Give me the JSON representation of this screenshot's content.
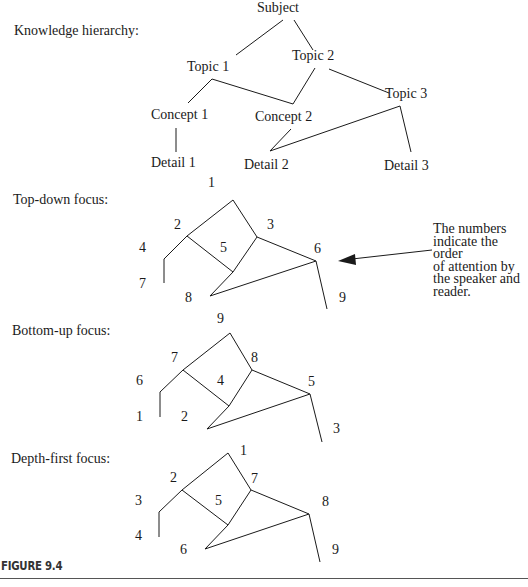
{
  "hierarchy": {
    "title": "Knowledge hierarchy:",
    "nodes": {
      "subject": "Subject",
      "topic1": "Topic 1",
      "topic2": "Topic 2",
      "topic3": "Topic 3",
      "concept1": "Concept 1",
      "concept2": "Concept 2",
      "detail1": "Detail 1",
      "detail2": "Detail 2",
      "detail3": "Detail 3"
    }
  },
  "top_down": {
    "title": "Top-down focus:",
    "order": {
      "subject": "1",
      "topic1": "2",
      "topic2": "3",
      "concept1": "4",
      "concept2": "5",
      "topic3": "6",
      "detail1": "7",
      "detail2": "8",
      "detail3": "9"
    }
  },
  "bottom_up": {
    "title": "Bottom-up focus:",
    "order": {
      "subject": "9",
      "topic1": "7",
      "topic2": "8",
      "concept1": "6",
      "concept2": "4",
      "topic3": "5",
      "detail1": "1",
      "detail2": "2",
      "detail3": "3"
    }
  },
  "depth_first": {
    "title": "Depth-first focus:",
    "order": {
      "subject": "1",
      "topic1": "2",
      "topic2": "7",
      "concept1": "3",
      "concept2": "5",
      "topic3": "8",
      "detail1": "4",
      "detail2": "6",
      "detail3": "9"
    }
  },
  "annotation": {
    "text": "The numbers\nindicate the order\nof attention by\nthe speaker and\nreader."
  },
  "caption": "FIGURE 9.4"
}
